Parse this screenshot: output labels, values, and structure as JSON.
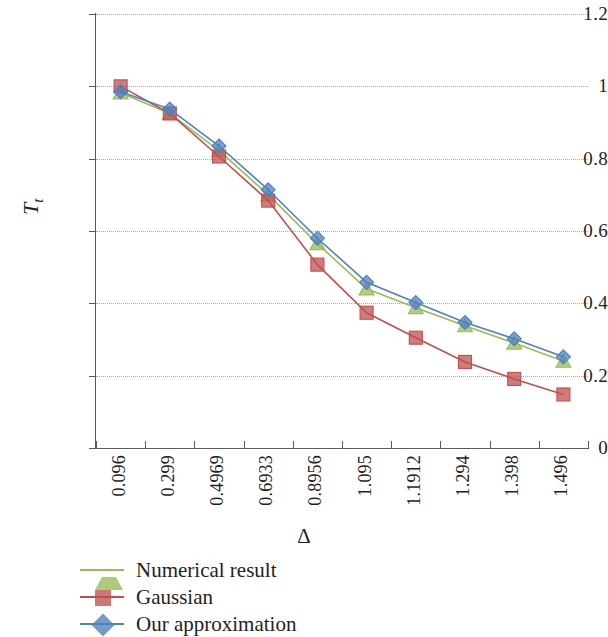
{
  "chart_data": {
    "type": "line",
    "title": "",
    "xlabel": "Δ",
    "ylabel": "T",
    "ylabel_sub": "t",
    "categories": [
      "0.096",
      "0.299",
      "0.4969",
      "0.6933",
      "0.8956",
      "1.095",
      "1.1912",
      "1.294",
      "1.398",
      "1.496"
    ],
    "x_tick_labels": [
      "0.096",
      "0.299",
      "0.4969",
      "0.6933",
      "0.8956",
      "1.095",
      "1.1912",
      "1.294",
      "1.398",
      "1.496"
    ],
    "y_tick_labels": [
      "1.2",
      "1",
      "0.8",
      "0.6",
      "0.4",
      "0.2",
      "0"
    ],
    "y_tick_values": [
      1.2,
      1.0,
      0.8,
      0.6,
      0.4,
      0.2,
      0
    ],
    "ylim": [
      0,
      1.2
    ],
    "grid": "horizontal-dotted",
    "legend_position": "bottom-left",
    "series": [
      {
        "name": "Numerical result",
        "color": "#9BBB59",
        "marker": "triangle",
        "values": [
          0.982,
          0.925,
          0.822,
          0.7,
          0.565,
          0.44,
          0.388,
          0.338,
          0.29,
          0.24
        ]
      },
      {
        "name": "Gaussian",
        "color": "#C0504D",
        "marker": "square",
        "values": [
          1.0,
          0.925,
          0.806,
          0.684,
          0.507,
          0.374,
          0.305,
          0.238,
          0.191,
          0.148
        ]
      },
      {
        "name": "Our approximation",
        "color": "#4F81BD",
        "marker": "diamond",
        "values": [
          0.985,
          0.937,
          0.835,
          0.714,
          0.58,
          0.458,
          0.402,
          0.347,
          0.302,
          0.252
        ]
      }
    ]
  },
  "legend": {
    "items": [
      {
        "label": "Numerical result",
        "color": "#9BBB59",
        "marker": "triangle"
      },
      {
        "label": "Gaussian",
        "color": "#C0504D",
        "marker": "square"
      },
      {
        "label": "Our approximation",
        "color": "#4F81BD",
        "marker": "diamond"
      }
    ]
  }
}
